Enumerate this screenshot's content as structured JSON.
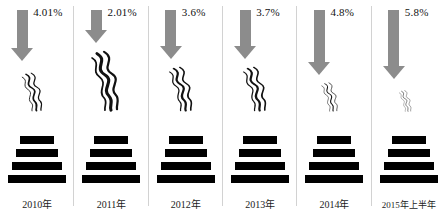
{
  "chart_data": {
    "type": "bar",
    "title": "",
    "subtitle": "",
    "xlabel": "",
    "ylabel": "",
    "grid": false,
    "legend": null,
    "categories": [
      "2010年",
      "2011年",
      "2012年",
      "2013年",
      "2014年",
      "2015年上半年"
    ],
    "values": [
      4.01,
      2.01,
      3.6,
      3.7,
      4.8,
      5.8
    ],
    "value_labels": [
      "4.01%",
      "2.01%",
      "3.6%",
      "3.7%",
      "4.8%",
      "5.8%"
    ],
    "series": [
      {
        "name": "",
        "values": [
          4.01,
          2.01,
          3.6,
          3.7,
          4.8,
          5.8
        ]
      }
    ],
    "annotations": [
      "Each column shows a gray downward arrow, a smoke plume and a four-bar black smokestack icon.",
      "Smoke plume size decreases from 2011 to 2015 as the arrow grows longer."
    ]
  },
  "figure": {
    "columns": [
      {
        "year": "2010年",
        "percent": "4.01%",
        "arrow_shaft_height": 38,
        "smoke_size": "medium",
        "smoke_height": 40,
        "smoke_width": 30,
        "smoke_bottom": 112
      },
      {
        "year": "2011年",
        "percent": "2.01%",
        "arrow_shaft_height": 20,
        "smoke_size": "largest",
        "smoke_height": 62,
        "smoke_width": 40,
        "smoke_bottom": 112
      },
      {
        "year": "2012年",
        "percent": "3.6%",
        "arrow_shaft_height": 36,
        "smoke_size": "large",
        "smoke_height": 46,
        "smoke_width": 34,
        "smoke_bottom": 112
      },
      {
        "year": "2013年",
        "percent": "3.7%",
        "arrow_shaft_height": 36,
        "smoke_size": "large",
        "smoke_height": 46,
        "smoke_width": 34,
        "smoke_bottom": 112
      },
      {
        "year": "2014年",
        "percent": "4.8%",
        "arrow_shaft_height": 52,
        "smoke_size": "small",
        "smoke_height": 30,
        "smoke_width": 24,
        "smoke_bottom": 112
      },
      {
        "year": "2015年上半年",
        "percent": "5.8%",
        "arrow_shaft_height": 56,
        "smoke_size": "smallest",
        "smoke_height": 22,
        "smoke_width": 18,
        "smoke_bottom": 112
      }
    ],
    "stack_bar_count": 4,
    "colors": {
      "arrow": "#8c8c8c",
      "stack_bar": "#000000",
      "divider": "#d2d2d2",
      "text": "#1a1a1a",
      "background": "#ffffff"
    }
  }
}
